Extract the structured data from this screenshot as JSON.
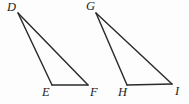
{
  "figure": {
    "background_color": "#fdfdfd",
    "stroke_color": "#2b2b2b",
    "label_color": "#1d1d1d",
    "width": 189,
    "height": 104,
    "triangles": [
      {
        "name": "triangle-def",
        "vertices": [
          {
            "label": "D",
            "x": 18,
            "y": 13,
            "label_x": 7,
            "label_y": 1,
            "role": "apex"
          },
          {
            "label": "E",
            "x": 52,
            "y": 85,
            "label_x": 42,
            "label_y": 86,
            "role": "base-left"
          },
          {
            "label": "F",
            "x": 88,
            "y": 85,
            "label_x": 90,
            "label_y": 86,
            "role": "base-right"
          }
        ],
        "edges": [
          {
            "from": "D",
            "to": "E"
          },
          {
            "from": "E",
            "to": "F"
          },
          {
            "from": "F",
            "to": "D"
          }
        ]
      },
      {
        "name": "triangle-ghi",
        "vertices": [
          {
            "label": "G",
            "x": 96,
            "y": 13,
            "label_x": 86,
            "label_y": 0,
            "role": "apex"
          },
          {
            "label": "H",
            "x": 127,
            "y": 85,
            "label_x": 118,
            "label_y": 86,
            "role": "base-left"
          },
          {
            "label": "I",
            "x": 172,
            "y": 84,
            "label_x": 175,
            "label_y": 85,
            "role": "base-right"
          }
        ],
        "edges": [
          {
            "from": "G",
            "to": "H"
          },
          {
            "from": "H",
            "to": "I"
          },
          {
            "from": "I",
            "to": "G"
          }
        ]
      }
    ]
  }
}
